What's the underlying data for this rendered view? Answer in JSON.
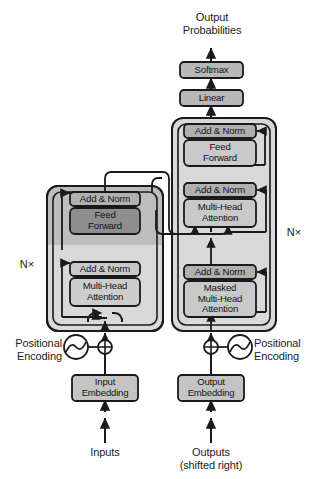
{
  "figure": {
    "title_top": "Output\nProbabilities",
    "bottom_left_label": "Inputs",
    "bottom_right_label": "Outputs\n(shifted right)"
  },
  "colors": {
    "background": "#ffffff",
    "stroke": "#1a1a1a",
    "stack_container": "#d9d9d9",
    "stack_container_dark": "#bdbdbd",
    "block_light": "#c9c9c9",
    "block_mid": "#b8b8b8",
    "block_dark": "#8e8e8e",
    "block_addnorm": "#b0b0b0",
    "text": "#141414"
  },
  "output_head": {
    "softmax_label": "Softmax",
    "linear_label": "Linear"
  },
  "encoder": {
    "repeat_label": "N×",
    "blocks": [
      {
        "label": "Add & Norm",
        "kind": "add-norm"
      },
      {
        "label": "Feed\nForward",
        "kind": "feed-forward"
      },
      {
        "label": "Add & Norm",
        "kind": "add-norm"
      },
      {
        "label": "Multi-Head\nAttention",
        "kind": "multi-head-attention"
      }
    ],
    "embedding_label": "Input\nEmbedding",
    "positional_label": "Positional\nEncoding"
  },
  "decoder": {
    "repeat_label": "N×",
    "blocks": [
      {
        "label": "Add & Norm",
        "kind": "add-norm"
      },
      {
        "label": "Feed\nForward",
        "kind": "feed-forward"
      },
      {
        "label": "Add & Norm",
        "kind": "add-norm"
      },
      {
        "label": "Multi-Head\nAttention",
        "kind": "multi-head-attention"
      },
      {
        "label": "Add & Norm",
        "kind": "add-norm"
      },
      {
        "label": "Masked\nMulti-Head\nAttention",
        "kind": "masked-multi-head-attention"
      }
    ],
    "embedding_label": "Output\nEmbedding",
    "positional_label": "Positional\nEncoding"
  }
}
